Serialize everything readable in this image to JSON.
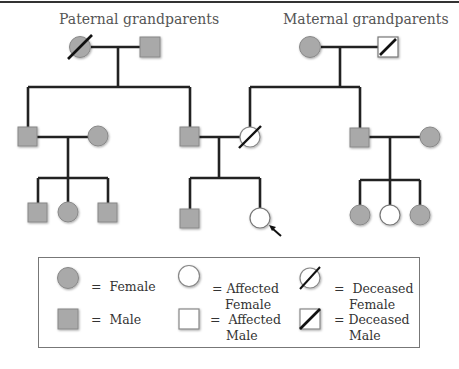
{
  "diagram": {
    "type": "pedigree chart",
    "titles": {
      "paternal": "Paternal grandparents",
      "maternal": "Maternal grandparents"
    },
    "colors": {
      "filled": "#a9a9a9",
      "line": "#222222",
      "affected": "#ffffff"
    },
    "legend": {
      "female": {
        "eq": "=",
        "label": "Female"
      },
      "male": {
        "eq": "=",
        "label": "Male"
      },
      "affected_female": {
        "line1": "= Affected",
        "line2": "Female"
      },
      "affected_male": {
        "line1": "=  Affected",
        "line2": "Male"
      },
      "deceased_female": {
        "line1": "=  Deceased",
        "line2": "Female"
      },
      "deceased_male": {
        "line1": "= Deceased",
        "line2": "Male"
      }
    },
    "individuals": [
      {
        "id": "paternal-grandmother",
        "sex": "female",
        "deceased": true,
        "affected": false
      },
      {
        "id": "paternal-grandfather",
        "sex": "male",
        "deceased": false,
        "affected": false
      },
      {
        "id": "maternal-grandmother",
        "sex": "female",
        "deceased": false,
        "affected": false
      },
      {
        "id": "maternal-grandfather",
        "sex": "male",
        "deceased": true,
        "affected": true
      },
      {
        "id": "paternal-uncle",
        "sex": "male"
      },
      {
        "id": "paternal-uncle-spouse",
        "sex": "female"
      },
      {
        "id": "father",
        "sex": "male"
      },
      {
        "id": "mother",
        "sex": "female",
        "deceased": true,
        "affected": true
      },
      {
        "id": "maternal-uncle",
        "sex": "male"
      },
      {
        "id": "maternal-uncle-spouse",
        "sex": "female"
      },
      {
        "id": "cousin-1",
        "sex": "male"
      },
      {
        "id": "cousin-2",
        "sex": "female"
      },
      {
        "id": "cousin-3",
        "sex": "male"
      },
      {
        "id": "brother",
        "sex": "male"
      },
      {
        "id": "proband",
        "sex": "female",
        "affected": true,
        "proband": true
      },
      {
        "id": "cousin-4",
        "sex": "female"
      },
      {
        "id": "cousin-5",
        "sex": "female",
        "affected": true
      },
      {
        "id": "cousin-6",
        "sex": "female"
      }
    ]
  }
}
